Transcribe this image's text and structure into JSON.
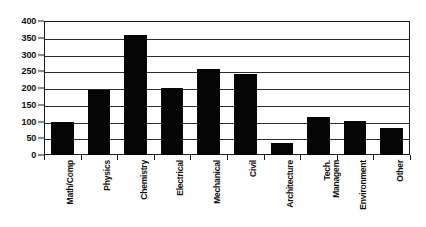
{
  "chart_data": {
    "type": "bar",
    "title": "",
    "subtitle": "",
    "xlabel": "",
    "ylabel": "",
    "categories": [
      "Math/Comp",
      "Physics",
      "Chemistry",
      "Electrical",
      "Mechanical",
      "Civil",
      "Architecture",
      "Tech. Managem",
      "Environment",
      "Other"
    ],
    "category_lines": [
      [
        "Math/Comp"
      ],
      [
        "Physics"
      ],
      [
        "Chemistry"
      ],
      [
        "Electrical"
      ],
      [
        "Mechanical"
      ],
      [
        "Civil"
      ],
      [
        "Architecture"
      ],
      [
        "Tech.",
        "Managem"
      ],
      [
        "Environment"
      ],
      [
        "Other"
      ]
    ],
    "values": [
      100,
      195,
      357,
      200,
      258,
      243,
      35,
      112,
      103,
      80
    ],
    "ylim": [
      0,
      400
    ],
    "ytick_step": 50,
    "yticks": [
      0,
      50,
      100,
      150,
      200,
      250,
      300,
      350,
      400
    ],
    "ytick_labels": [
      "0",
      "50",
      "100",
      "150",
      "200",
      "250",
      "300",
      "350",
      "400"
    ],
    "grid": true,
    "grid_axis": "y",
    "legend": false,
    "legend_position": "none",
    "bar_color": "#050505",
    "background_color": "#ffffff",
    "axis_color": "#1a1a1a",
    "series": [
      {
        "name": "Count",
        "values": [
          100,
          195,
          357,
          200,
          258,
          243,
          35,
          112,
          103,
          80
        ]
      }
    ]
  }
}
